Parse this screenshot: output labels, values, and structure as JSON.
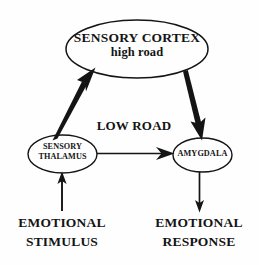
{
  "diagram": {
    "background_color": "#fefefe",
    "stroke_color": "#141414",
    "nodes": {
      "cortex": {
        "name": "sensory-cortex",
        "line1": "SENSORY CORTEX",
        "line2": "high road",
        "shape": "ellipse"
      },
      "thalamus": {
        "name": "sensory-thalamus",
        "line1": "SENSORY",
        "line2": "THALAMUS",
        "shape": "ellipse"
      },
      "amygdala": {
        "name": "amygdala",
        "line1": "AMYGDALA",
        "shape": "ellipse"
      }
    },
    "edge_labels": {
      "low_road": "LOW ROAD"
    },
    "terminals": {
      "stimulus": {
        "line1": "EMOTIONAL",
        "line2": "STIMULUS"
      },
      "response": {
        "line1": "EMOTIONAL",
        "line2": "RESPONSE"
      }
    },
    "arrows": [
      {
        "name": "stimulus-to-thalamus",
        "from": "EMOTIONAL STIMULUS",
        "to": "SENSORY THALAMUS",
        "direction": "up"
      },
      {
        "name": "thalamus-to-cortex",
        "from": "SENSORY THALAMUS",
        "to": "SENSORY CORTEX",
        "direction": "up-right"
      },
      {
        "name": "cortex-to-amygdala",
        "from": "SENSORY CORTEX",
        "to": "AMYGDALA",
        "direction": "down-right"
      },
      {
        "name": "thalamus-to-amygdala",
        "from": "SENSORY THALAMUS",
        "to": "AMYGDALA",
        "direction": "right"
      },
      {
        "name": "amygdala-to-response",
        "from": "AMYGDALA",
        "to": "EMOTIONAL RESPONSE",
        "direction": "down"
      }
    ]
  }
}
